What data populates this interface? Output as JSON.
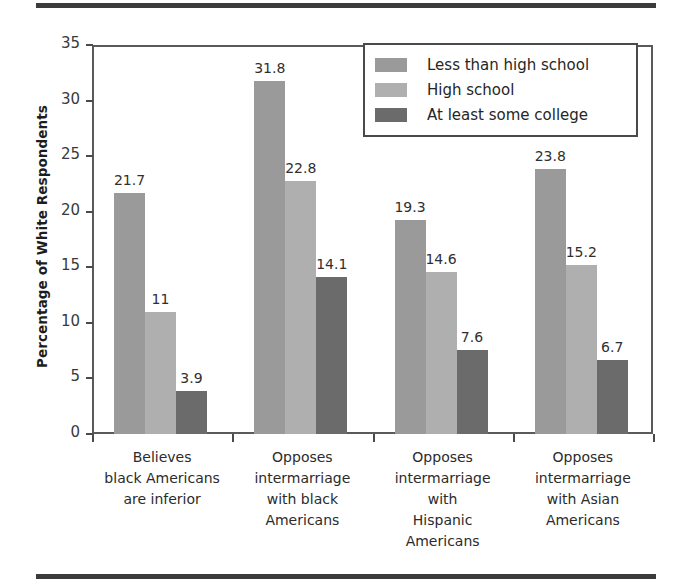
{
  "figure": {
    "top_rule": "horizontal-rule",
    "bottom_rule": "horizontal-rule"
  },
  "chart_data": {
    "type": "bar",
    "title": "",
    "xlabel": "",
    "ylabel": "Percentage of White Respondents",
    "ylim": [
      0,
      35
    ],
    "yticks": [
      0,
      5,
      10,
      15,
      20,
      25,
      30,
      35
    ],
    "ytick_labels": [
      "0",
      "5",
      "10",
      "15",
      "20",
      "25",
      "30",
      "35"
    ],
    "grid": false,
    "legend_position": "top-right",
    "categories": [
      "Believes\nblack Americans\nare inferior",
      "Opposes\nintermarriage\nwith black\nAmericans",
      "Opposes\nintermarriage\nwith\nHispanic\nAmericans",
      "Opposes\nintermarriage\nwith Asian\nAmericans"
    ],
    "category_lines": [
      [
        "Believes",
        "black Americans",
        "are inferior"
      ],
      [
        "Opposes",
        "intermarriage",
        "with black",
        "Americans"
      ],
      [
        "Opposes",
        "intermarriage",
        "with",
        "Hispanic",
        "Americans"
      ],
      [
        "Opposes",
        "intermarriage",
        "with Asian",
        "Americans"
      ]
    ],
    "series": [
      {
        "name": "Less than high school",
        "color": "#9a9a9a",
        "values": [
          21.7,
          31.8,
          19.3,
          23.8
        ],
        "labels": [
          "21.7",
          "31.8",
          "19.3",
          "23.8"
        ]
      },
      {
        "name": "High school",
        "color": "#afafaf",
        "values": [
          11,
          22.8,
          14.6,
          15.2
        ],
        "labels": [
          "11",
          "22.8",
          "14.6",
          "15.2"
        ]
      },
      {
        "name": "At least some college",
        "color": "#6b6b6b",
        "values": [
          3.9,
          14.1,
          7.6,
          6.7
        ],
        "labels": [
          "3.9",
          "14.1",
          "7.6",
          "6.7"
        ]
      }
    ]
  }
}
